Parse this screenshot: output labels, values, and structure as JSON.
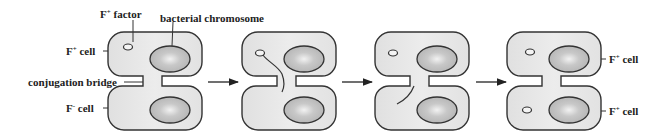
{
  "labels": {
    "f_factor": "F",
    "f_factor_sup": "+",
    "f_factor_rest": " factor",
    "bacterial_chromosome": "bacterial chromosome",
    "f_plus_cell": "F",
    "f_plus_sup": "+",
    "cell_word": " cell",
    "conjugation_bridge": "conjugation bridge",
    "f_minus_cell": "F",
    "f_minus_sup": "-",
    "result_top": "F",
    "result_top_sup": "+",
    "result_bottom": "F",
    "result_bottom_sup": "+"
  },
  "stages": [
    {
      "name": "initial-pairing",
      "plasmid_top": true,
      "plasmid_bottom": false,
      "strand": "none"
    },
    {
      "name": "strand-transfer-start",
      "plasmid_top": true,
      "plasmid_bottom": false,
      "strand": "from-plasmid-through-bridge"
    },
    {
      "name": "strand-in-recipient",
      "plasmid_top": true,
      "plasmid_bottom": false,
      "strand": "in-bottom-cell"
    },
    {
      "name": "both-f-plus",
      "plasmid_top": true,
      "plasmid_bottom": true,
      "strand": "none"
    }
  ],
  "colors": {
    "cell_fill": "#e6e6e6",
    "cell_stroke": "#333333",
    "chromosome_fill": "#bdbdbd",
    "text": "#222222"
  }
}
